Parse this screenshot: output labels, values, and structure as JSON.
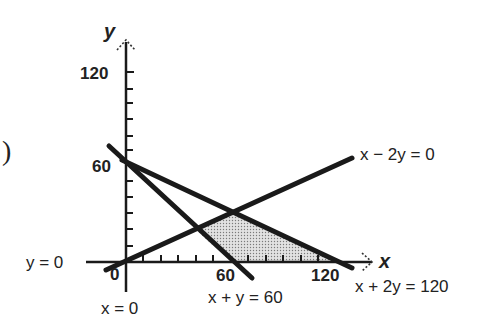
{
  "figure": {
    "left_marker": ")",
    "axes": {
      "x_label": "x",
      "y_label": "y",
      "x_ticks": [
        "0",
        "60",
        "120"
      ],
      "y_ticks": [
        "60",
        "120"
      ]
    },
    "lines": [
      {
        "name": "x-axis-line",
        "label": "y = 0"
      },
      {
        "name": "y-axis-line",
        "label": "x = 0"
      },
      {
        "name": "line-x-plus-y",
        "label": "x + y = 60"
      },
      {
        "name": "line-x-minus-2y",
        "label": "x − 2y = 0"
      },
      {
        "name": "line-x-plus-2y",
        "label": "x + 2y = 120"
      }
    ],
    "shaded_region": {
      "description": "Feasible region bounded by x + y = 60, x − 2y = 0, x + 2y = 120 and y = 0",
      "vertices": [
        [
          40,
          20
        ],
        [
          60,
          30
        ],
        [
          120,
          0
        ],
        [
          60,
          0
        ]
      ],
      "fill": "#c8c8c8"
    },
    "colors": {
      "line": "#1a1a1a",
      "text": "#222222",
      "shade": "#c8c8c8"
    }
  }
}
